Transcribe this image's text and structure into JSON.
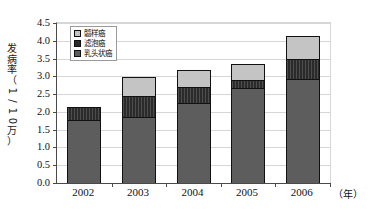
{
  "chart_data": {
    "type": "bar",
    "stacked": true,
    "title": "",
    "subtitle": "",
    "xlabel": "（年）",
    "ylabel": "发病率（1/10万）",
    "categories": [
      "2002",
      "2003",
      "2004",
      "2005",
      "2006"
    ],
    "series": [
      {
        "name": "髓样癌",
        "color": "#c4c4c4",
        "values": [
          0.0,
          0.55,
          0.5,
          0.46,
          0.66
        ]
      },
      {
        "name": "滤泡癌",
        "color": "#2b2b2b",
        "values": [
          0.38,
          0.57,
          0.43,
          0.21,
          0.56
        ]
      },
      {
        "name": "乳头状癌",
        "color": "#5d5d5d",
        "values": [
          1.77,
          1.87,
          2.26,
          2.68,
          2.92
        ]
      }
    ],
    "totals": [
      2.15,
      2.99,
      3.19,
      3.35,
      4.14
    ],
    "ylim": [
      0.0,
      4.5
    ],
    "ytick_step": 0.5,
    "yticks": [
      "4.5",
      "4.0",
      "3.5",
      "3.0",
      "2.5",
      "2.0",
      "1.5",
      "1.0",
      "0.5",
      "0.0"
    ],
    "grid": true,
    "legend_position": "top-left",
    "stack_order_bottom_to_top": [
      "乳头状癌",
      "滤泡癌",
      "髓样癌"
    ]
  },
  "legend": {
    "items": [
      {
        "label": "髓样癌",
        "swatch": "#c4c4c4"
      },
      {
        "label": "滤泡癌",
        "swatch": "#2b2b2b"
      },
      {
        "label": "乳头状癌",
        "swatch": "#5d5d5d"
      }
    ]
  },
  "axes": {
    "y_title_chars": [
      "发",
      "病",
      "率",
      "（",
      "1",
      "/",
      "1",
      "0",
      "万",
      "）"
    ],
    "x_unit": "（年）"
  }
}
